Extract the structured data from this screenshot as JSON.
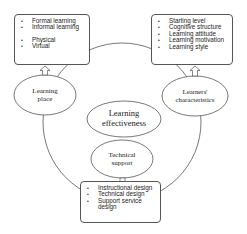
{
  "center": {
    "label_line1": "Learning",
    "label_line2": "effectiveness"
  },
  "nodes": {
    "learning_place": {
      "line1": "Learning",
      "line2": "place"
    },
    "learners_characteristics": {
      "line1": "Learners'",
      "line2": "characteristics"
    },
    "technical_support": {
      "line1": "Technical",
      "line2": "support"
    }
  },
  "boxes": {
    "learning_place": {
      "items": [
        "Formal learning",
        "Informal learning",
        "Physical",
        "Virtual"
      ]
    },
    "learners_characteristics": {
      "items": [
        "Starting level",
        "Cognitive structure",
        "Learning attitude",
        "Learning motivation",
        "Learning style"
      ]
    },
    "technical_support": {
      "items": [
        "Instructional design",
        "Technical design",
        "Support service design"
      ]
    }
  },
  "colors": {
    "stroke": "#555555",
    "text": "#222222",
    "background": "#ffffff"
  }
}
